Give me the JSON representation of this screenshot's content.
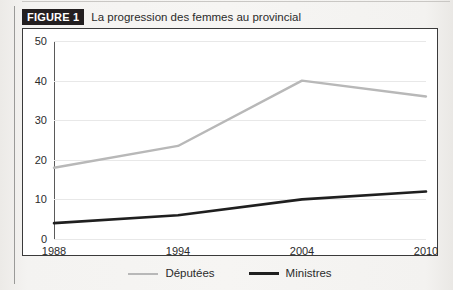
{
  "figure": {
    "badge": "FIGURE 1",
    "caption": "La progression des femmes au provincial"
  },
  "colors": {
    "deputees": "#b8b8b8",
    "ministres": "#1f1f1f",
    "badge_background": "#231f20",
    "frame_border": "#3a3a3a",
    "gridline": "#e8e8e8",
    "page_background": "#f4f3f1"
  },
  "legend": {
    "position": "bottom-center",
    "items": [
      {
        "label": "Députées",
        "color": "#b8b8b8",
        "icon": "line-swatch-icon"
      },
      {
        "label": "Ministres",
        "color": "#1f1f1f",
        "icon": "line-swatch-icon"
      }
    ]
  },
  "axes": {
    "y_ticks": [
      "50",
      "40",
      "30",
      "20",
      "10",
      "0"
    ],
    "x_ticks": [
      "1988",
      "1994",
      "2004",
      "2010"
    ]
  },
  "chart_data": {
    "type": "line",
    "title": "La progression des femmes au provincial",
    "xlabel": "",
    "ylabel": "",
    "categories": [
      "1988",
      "1994",
      "2004",
      "2010"
    ],
    "x": [
      1988,
      1994,
      2004,
      2010
    ],
    "series": [
      {
        "name": "Députées",
        "color": "#b8b8b8",
        "values": [
          18,
          23.5,
          40,
          36
        ]
      },
      {
        "name": "Ministres",
        "color": "#1f1f1f",
        "values": [
          4,
          6,
          10,
          12
        ]
      }
    ],
    "ylim": [
      0,
      50
    ],
    "yticks": [
      0,
      10,
      20,
      30,
      40,
      50
    ],
    "grid": true,
    "legend": "bottom-center"
  }
}
